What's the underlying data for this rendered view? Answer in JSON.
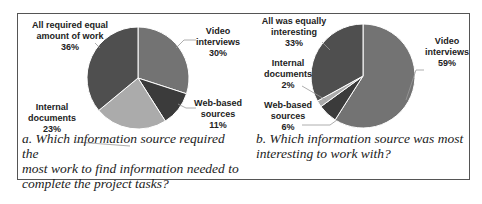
{
  "chart_data": [
    {
      "type": "pie",
      "title": "a. Which information source required the most work to find information needed to complete the project tasks?",
      "categories": [
        "Video interviews",
        "Web-based sources",
        "Internal documents",
        "All required equal amount of work"
      ],
      "values": [
        30,
        11,
        23,
        36
      ],
      "unit": "%",
      "colors": [
        "#737373",
        "#3b3b3b",
        "#ababab",
        "#4f4f4f"
      ]
    },
    {
      "type": "pie",
      "title": "b. Which information source was most interesting to work with?",
      "categories": [
        "Video interviews",
        "Web-based sources",
        "Internal documents",
        "All was equally interesting"
      ],
      "values": [
        59,
        6,
        2,
        33
      ],
      "unit": "%",
      "colors": [
        "#737373",
        "#3b3b3b",
        "#ababab",
        "#4f4f4f"
      ]
    }
  ],
  "left": {
    "labels": {
      "equal": [
        "All required equal",
        "amount of work",
        "36%"
      ],
      "video": [
        "Video",
        "interviews",
        "30%"
      ],
      "web": [
        "Web-based",
        "sources",
        "11%"
      ],
      "internal": [
        "Internal",
        "documents",
        "23%"
      ]
    },
    "caption": [
      "a. Which information source required the",
      "most work to find information needed to",
      "complete the project tasks?"
    ]
  },
  "right": {
    "labels": {
      "equal": [
        "All was equally",
        "interesting",
        "33%"
      ],
      "video": [
        "Video",
        "interviews",
        "59%"
      ],
      "web": [
        "Web-based",
        "sources",
        "6%"
      ],
      "internal": [
        "Internal",
        "documents",
        "2%"
      ]
    },
    "caption": [
      "b. Which information source was most",
      "interesting to work with?"
    ]
  }
}
